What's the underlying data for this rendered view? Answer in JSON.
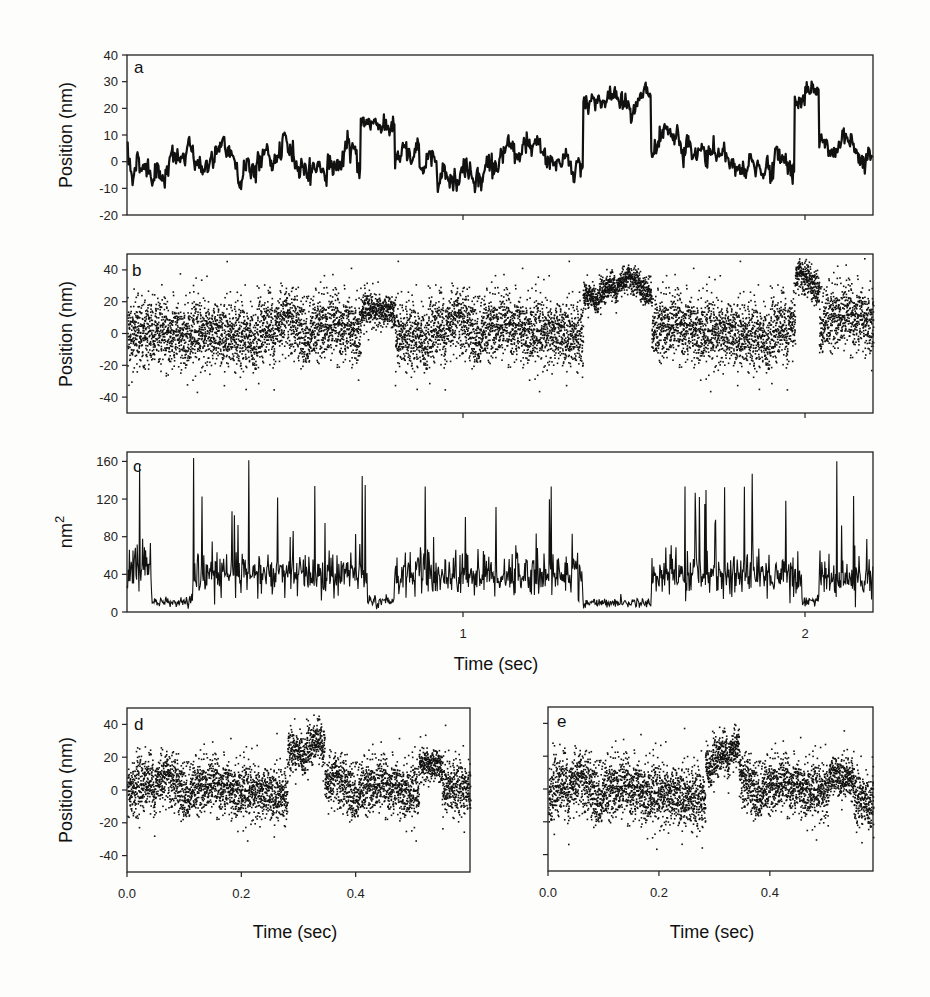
{
  "figure": {
    "panels": [
      "a",
      "b",
      "c",
      "d",
      "e"
    ],
    "shared_xlabel_top": "Time (sec)"
  },
  "chart_data": [
    {
      "id": "a",
      "type": "line",
      "panel_letter": "a",
      "title": "",
      "xlabel": "",
      "ylabel": "Position (nm)",
      "ylim": [
        -20,
        40
      ],
      "yticks": [
        -20,
        -10,
        0,
        10,
        20,
        30,
        40
      ],
      "ytick_labels": [
        "-20",
        "-10",
        "0",
        "10",
        "20",
        "30",
        "40"
      ],
      "xlim": [
        0.02,
        2.2
      ],
      "xticks": [
        1,
        2
      ],
      "xtick_labels": [],
      "grid": false,
      "description": "Filtered bead position trace; baseline near 0 nm with binding events",
      "segments": [
        {
          "t0": 0.02,
          "t1": 0.7,
          "level": 0,
          "noise": 5
        },
        {
          "t0": 0.7,
          "t1": 0.8,
          "level": 15,
          "noise": 3
        },
        {
          "t0": 0.8,
          "t1": 1.35,
          "level": 0,
          "noise": 5
        },
        {
          "t0": 1.35,
          "t1": 1.55,
          "level": 24,
          "noise": 3
        },
        {
          "t0": 1.55,
          "t1": 1.97,
          "level": 0,
          "noise": 5
        },
        {
          "t0": 1.97,
          "t1": 2.04,
          "level": 24,
          "noise": 3
        },
        {
          "t0": 2.04,
          "t1": 2.2,
          "level": 6,
          "noise": 4
        }
      ]
    },
    {
      "id": "b",
      "type": "scatter",
      "panel_letter": "b",
      "xlabel": "",
      "ylabel": "Position (nm)",
      "ylim": [
        -50,
        50
      ],
      "yticks": [
        -40,
        -20,
        0,
        20,
        40
      ],
      "ytick_labels": [
        "-40",
        "-20",
        "0",
        "20",
        "40"
      ],
      "xlim": [
        0.02,
        2.2
      ],
      "xticks": [
        1,
        2
      ],
      "xtick_labels": [],
      "grid": false,
      "description": "Raw position data points; variance drops during bound states",
      "segments": [
        {
          "t0": 0.02,
          "t1": 0.2,
          "level": 0,
          "noise": 10
        },
        {
          "t0": 0.2,
          "t1": 0.7,
          "level": 2,
          "noise": 10
        },
        {
          "t0": 0.7,
          "t1": 0.8,
          "level": 16,
          "noise": 5
        },
        {
          "t0": 0.8,
          "t1": 1.35,
          "level": 2,
          "noise": 10
        },
        {
          "t0": 1.35,
          "t1": 1.55,
          "level": 28,
          "noise": 4
        },
        {
          "t0": 1.55,
          "t1": 1.97,
          "level": 2,
          "noise": 10
        },
        {
          "t0": 1.97,
          "t1": 2.04,
          "level": 30,
          "noise": 5
        },
        {
          "t0": 2.04,
          "t1": 2.2,
          "level": 8,
          "noise": 10
        }
      ]
    },
    {
      "id": "c",
      "type": "line",
      "panel_letter": "c",
      "xlabel": "Time (sec)",
      "ylabel": "nm2",
      "ylim": [
        0,
        170
      ],
      "yticks": [
        0,
        40,
        80,
        120,
        160
      ],
      "ytick_labels": [
        "0",
        "40",
        "80",
        "120",
        "160"
      ],
      "xlim": [
        0.02,
        2.2
      ],
      "xticks": [
        1,
        2
      ],
      "xtick_labels": [
        "1",
        "2"
      ],
      "grid": false,
      "description": "Running variance (nm^2); low (~10) during bound states, ~40 with spikes up to 160 when unbound",
      "segments": [
        {
          "t0": 0.02,
          "t1": 0.09,
          "level": 50,
          "noise": 25
        },
        {
          "t0": 0.09,
          "t1": 0.21,
          "level": 10,
          "noise": 4
        },
        {
          "t0": 0.21,
          "t1": 0.72,
          "level": 40,
          "noise": 20
        },
        {
          "t0": 0.72,
          "t1": 0.8,
          "level": 12,
          "noise": 5
        },
        {
          "t0": 0.8,
          "t1": 1.35,
          "level": 40,
          "noise": 20
        },
        {
          "t0": 1.35,
          "t1": 1.55,
          "level": 10,
          "noise": 4
        },
        {
          "t0": 1.55,
          "t1": 1.99,
          "level": 40,
          "noise": 20
        },
        {
          "t0": 1.99,
          "t1": 2.04,
          "level": 12,
          "noise": 5
        },
        {
          "t0": 2.04,
          "t1": 2.2,
          "level": 35,
          "noise": 18
        }
      ],
      "spike_max": 168
    },
    {
      "id": "d",
      "type": "scatter",
      "panel_letter": "d",
      "xlabel": "Time (sec)",
      "ylabel": "Position (nm)",
      "ylim": [
        -50,
        50
      ],
      "yticks": [
        -40,
        -20,
        0,
        20,
        40
      ],
      "ytick_labels": [
        "-40",
        "-20",
        "0",
        "20",
        "40"
      ],
      "xlim": [
        0.0,
        0.6
      ],
      "xticks": [
        0.0,
        0.2,
        0.4
      ],
      "xtick_labels": [
        "0.0",
        "0.2",
        "0.4"
      ],
      "grid": false,
      "segments": [
        {
          "t0": 0.0,
          "t1": 0.28,
          "level": 0,
          "noise": 8
        },
        {
          "t0": 0.28,
          "t1": 0.345,
          "level": 28,
          "noise": 6
        },
        {
          "t0": 0.345,
          "t1": 0.51,
          "level": 0,
          "noise": 8
        },
        {
          "t0": 0.51,
          "t1": 0.55,
          "level": 17,
          "noise": 5
        },
        {
          "t0": 0.55,
          "t1": 0.6,
          "level": 5,
          "noise": 8
        }
      ]
    },
    {
      "id": "e",
      "type": "scatter",
      "panel_letter": "e",
      "xlabel": "Time (sec)",
      "ylabel": "",
      "ylim": [
        -50,
        50
      ],
      "yticks": [
        -40,
        -20,
        0,
        20,
        40
      ],
      "ytick_labels": [],
      "xlim": [
        0.0,
        0.58
      ],
      "xticks": [
        0.0,
        0.2,
        0.4
      ],
      "xtick_labels": [
        "0.0",
        "0.2",
        "0.4"
      ],
      "grid": false,
      "segments": [
        {
          "t0": 0.0,
          "t1": 0.28,
          "level": -2,
          "noise": 9
        },
        {
          "t0": 0.28,
          "t1": 0.34,
          "level": 20,
          "noise": 6
        },
        {
          "t0": 0.34,
          "t1": 0.5,
          "level": 0,
          "noise": 8
        },
        {
          "t0": 0.5,
          "t1": 0.545,
          "level": 10,
          "noise": 6
        },
        {
          "t0": 0.545,
          "t1": 0.58,
          "level": -2,
          "noise": 8
        }
      ]
    }
  ]
}
